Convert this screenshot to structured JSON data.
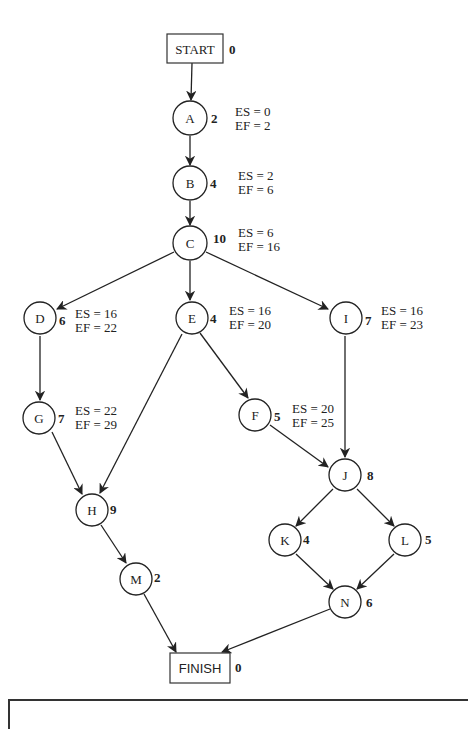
{
  "diagram": {
    "type": "activity-on-node network",
    "start": {
      "label": "START",
      "duration": "0"
    },
    "finish": {
      "label": "FINISH",
      "duration": "0"
    },
    "nodes": {
      "A": {
        "label": "A",
        "duration": "2",
        "es": "ES = 0",
        "ef": "EF = 2"
      },
      "B": {
        "label": "B",
        "duration": "4",
        "es": "ES = 2",
        "ef": "EF = 6"
      },
      "C": {
        "label": "C",
        "duration": "10",
        "es": "ES = 6",
        "ef": "EF = 16"
      },
      "D": {
        "label": "D",
        "duration": "6",
        "es": "ES = 16",
        "ef": "EF = 22"
      },
      "E": {
        "label": "E",
        "duration": "4",
        "es": "ES = 16",
        "ef": "EF = 20"
      },
      "I": {
        "label": "I",
        "duration": "7",
        "es": "ES = 16",
        "ef": "EF = 23"
      },
      "G": {
        "label": "G",
        "duration": "7",
        "es": "ES = 22",
        "ef": "EF = 29"
      },
      "F": {
        "label": "F",
        "duration": "5",
        "es": "ES = 20",
        "ef": "EF = 25"
      },
      "J": {
        "label": "J",
        "duration": "8"
      },
      "H": {
        "label": "H",
        "duration": "9"
      },
      "K": {
        "label": "K",
        "duration": "4"
      },
      "L": {
        "label": "L",
        "duration": "5"
      },
      "M": {
        "label": "M",
        "duration": "2"
      },
      "N": {
        "label": "N",
        "duration": "6"
      }
    },
    "edges": [
      [
        "START",
        "A"
      ],
      [
        "A",
        "B"
      ],
      [
        "B",
        "C"
      ],
      [
        "C",
        "D"
      ],
      [
        "C",
        "E"
      ],
      [
        "C",
        "I"
      ],
      [
        "D",
        "G"
      ],
      [
        "G",
        "H"
      ],
      [
        "E",
        "H"
      ],
      [
        "E",
        "F"
      ],
      [
        "F",
        "J"
      ],
      [
        "I",
        "J"
      ],
      [
        "J",
        "K"
      ],
      [
        "J",
        "L"
      ],
      [
        "K",
        "N"
      ],
      [
        "L",
        "N"
      ],
      [
        "H",
        "M"
      ],
      [
        "M",
        "FINISH"
      ],
      [
        "N",
        "FINISH"
      ]
    ]
  }
}
